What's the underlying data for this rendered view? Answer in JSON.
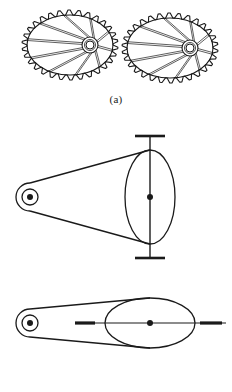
{
  "figure": {
    "background_color": "#ffffff",
    "line_color": "#1a1a1a",
    "width": 232,
    "height": 392
  },
  "panels": [
    {
      "id": "panel-a",
      "caption": "(a)",
      "description": "Pair of meshing elliptical spur gears",
      "items": [
        {
          "name": "left-elliptical-gear",
          "shape": "ellipse",
          "center_x": 70,
          "center_y": 45,
          "rx": 43,
          "ry": 30,
          "teeth": 30,
          "tooth_height": 5,
          "hub_center_x": 90,
          "hub_center_y": 45,
          "hub_outer_r": 8,
          "hub_inner_r": 4,
          "spokes": 10
        },
        {
          "name": "right-elliptical-gear",
          "shape": "ellipse",
          "center_x": 170,
          "center_y": 48,
          "rx": 43,
          "ry": 30,
          "teeth": 30,
          "tooth_height": 5,
          "hub_center_x": 190,
          "hub_center_y": 48,
          "hub_outer_r": 8,
          "hub_inner_r": 4,
          "spokes": 10
        }
      ]
    },
    {
      "id": "panel-b",
      "caption": "(b)",
      "description": "Belt drive between small pulley and large pulley, shown with vertical shaft and with horizontal shaft",
      "views": [
        {
          "name": "vertical-shaft-view",
          "small_pulley": {
            "center_x": 30,
            "center_y": 197,
            "outer_r": 14,
            "hub_r": 8,
            "center_dot_r": 3
          },
          "large_pulley": {
            "center_x": 150,
            "center_y": 197,
            "rx": 25,
            "ry": 47,
            "center_dot_r": 3
          },
          "shaft": {
            "orientation": "vertical",
            "x": 150,
            "y_top": 136,
            "y_bottom": 258,
            "cap_half_width": 15
          }
        },
        {
          "name": "horizontal-shaft-view",
          "small_pulley": {
            "center_x": 30,
            "center_y": 323,
            "outer_r": 14,
            "hub_r": 8,
            "center_dot_r": 3
          },
          "large_pulley": {
            "center_x": 150,
            "center_y": 323,
            "rx": 45,
            "ry": 25,
            "center_dot_r": 3
          },
          "shaft": {
            "orientation": "horizontal",
            "y": 323,
            "x_left": 75,
            "x_right": 226,
            "left_dash_from": 75,
            "left_dash_to": 95,
            "right_dash_from": 200,
            "right_dash_to": 222
          }
        }
      ]
    }
  ]
}
